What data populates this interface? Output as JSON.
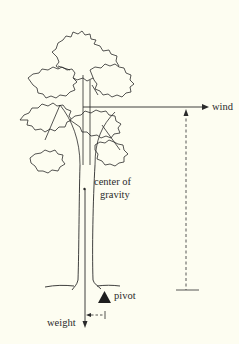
{
  "diagram": {
    "labels": {
      "wind": "wind",
      "center_of_gravity_line1": "center of",
      "center_of_gravity_line2": "gravity",
      "pivot": "pivot",
      "weight": "weight"
    },
    "colors": {
      "background": "#FDFDF1",
      "ink": "#2a2a2a"
    }
  }
}
